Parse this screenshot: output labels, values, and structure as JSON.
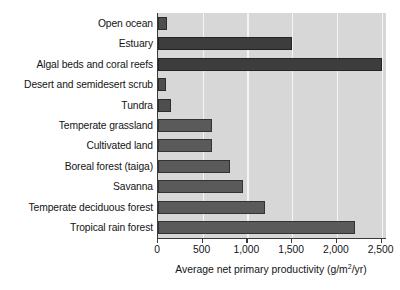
{
  "chart_data": {
    "type": "bar",
    "orientation": "horizontal",
    "title": "",
    "xlabel": "Average net primary productivity (g/m2/yr)",
    "xlabel_parts": {
      "before": "Average net primary productivity (g/m",
      "superscript": "2",
      "after": "/yr)"
    },
    "ylabel": "",
    "categories": [
      "Open ocean",
      "Estuary",
      "Algal beds and coral reefs",
      "Desert and semidesert scrub",
      "Tundra",
      "Temperate grassland",
      "Cultivated land",
      "Boreal forest (taiga)",
      "Savanna",
      "Temperate deciduous forest",
      "Tropical rain forest"
    ],
    "values": [
      100,
      1500,
      2500,
      90,
      140,
      600,
      600,
      800,
      950,
      1200,
      2200
    ],
    "xlim": [
      0,
      2550
    ],
    "xticks": [
      0,
      500,
      1000,
      1500,
      2000,
      2500
    ],
    "xticklabels": [
      "0",
      "500",
      "1,000",
      "1,500",
      "2,000",
      "2,500"
    ],
    "grid": "vertical-white",
    "legend": "none",
    "colors": {
      "bar_fill": "#4e4e4e",
      "bar_edge": "#2c2c2c",
      "plot_background": "#d7d7d7",
      "gridline": "#f4f4f4",
      "axis": "#3a3a3a",
      "page_background": "#ffffff",
      "text": "#141414"
    }
  }
}
